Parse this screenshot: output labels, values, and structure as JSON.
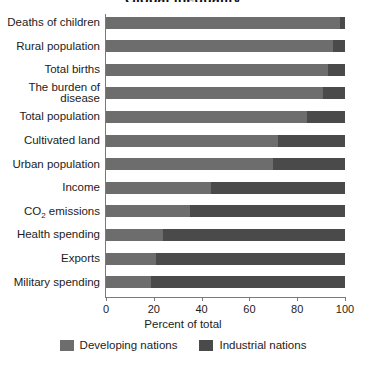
{
  "title": "Global inequality",
  "chart_data": {
    "type": "bar",
    "orientation": "horizontal",
    "stacked": true,
    "normalized_percent": true,
    "title": "Global inequality",
    "xlabel": "Percent of total",
    "ylabel": "",
    "xlim": [
      0,
      100
    ],
    "xticks": [
      0,
      20,
      40,
      60,
      80,
      100
    ],
    "xtick_labels": [
      "0",
      "20",
      "40",
      "60",
      "80",
      "100"
    ],
    "grid": false,
    "legend_position": "bottom",
    "categories": [
      "Deaths of children",
      "Rural population",
      "Total births",
      "The burden of disease",
      "Total population",
      "Cultivated land",
      "Urban population",
      "Income",
      "CO2 emissions",
      "Health spending",
      "Exports",
      "Military spending"
    ],
    "series": [
      {
        "name": "Developing nations",
        "color": "#6d6d6d",
        "values": [
          98,
          95,
          93,
          91,
          84,
          72,
          70,
          44,
          35,
          24,
          21,
          19
        ]
      },
      {
        "name": "Industrial nations",
        "color": "#4a4a4a",
        "values": [
          2,
          5,
          7,
          9,
          16,
          28,
          30,
          56,
          65,
          76,
          79,
          81
        ]
      }
    ]
  },
  "axis": {
    "x_title": "Percent of total",
    "ticks": [
      "0",
      "20",
      "40",
      "60",
      "80",
      "100"
    ]
  },
  "legend": {
    "items": [
      {
        "label": "Developing nations",
        "color": "#6d6d6d"
      },
      {
        "label": "Industrial nations",
        "color": "#4a4a4a"
      }
    ]
  },
  "rows": [
    {
      "label": "Deaths of children",
      "developing": 98,
      "industrial": 2
    },
    {
      "label": "Rural population",
      "developing": 95,
      "industrial": 5
    },
    {
      "label": "Total births",
      "developing": 93,
      "industrial": 7
    },
    {
      "label": "The burden of disease",
      "developing": 91,
      "industrial": 9
    },
    {
      "label": "Total population",
      "developing": 84,
      "industrial": 16
    },
    {
      "label": "Cultivated land",
      "developing": 72,
      "industrial": 28
    },
    {
      "label": "Urban population",
      "developing": 70,
      "industrial": 30
    },
    {
      "label": "Income",
      "developing": 44,
      "industrial": 56
    },
    {
      "label": "CO2 emissions",
      "developing": 35,
      "industrial": 65
    },
    {
      "label": "Health spending",
      "developing": 24,
      "industrial": 76
    },
    {
      "label": "Exports",
      "developing": 21,
      "industrial": 79
    },
    {
      "label": "Military spending",
      "developing": 19,
      "industrial": 81
    }
  ]
}
